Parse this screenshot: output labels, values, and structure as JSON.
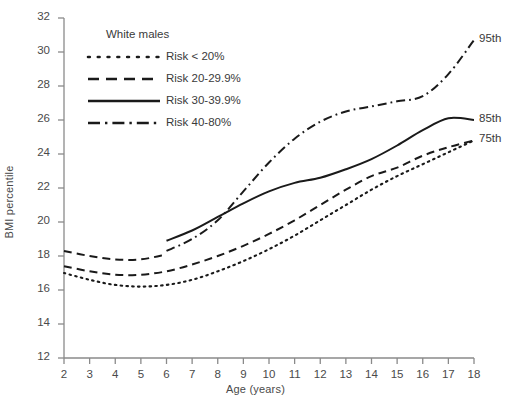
{
  "chart_data": {
    "type": "line",
    "title": "",
    "xlabel": "Age (years)",
    "ylabel": "BMI percentile",
    "xlim": [
      2,
      18
    ],
    "ylim": [
      12,
      32
    ],
    "xticks": [
      2,
      3,
      4,
      5,
      6,
      7,
      8,
      9,
      10,
      11,
      12,
      13,
      14,
      15,
      16,
      17,
      18
    ],
    "yticks": [
      12,
      14,
      16,
      18,
      20,
      22,
      24,
      26,
      28,
      30,
      32
    ],
    "grid": false,
    "legend_position": "top-left",
    "legend_title": "White males",
    "series": [
      {
        "name": "Risk < 20%",
        "style": "dotted",
        "end_label": "",
        "x": [
          2,
          3,
          4,
          5,
          6,
          7,
          8,
          9,
          10,
          11,
          12,
          13,
          14,
          15,
          16,
          17,
          18
        ],
        "values": [
          17.0,
          16.6,
          16.3,
          16.2,
          16.3,
          16.6,
          17.1,
          17.7,
          18.4,
          19.2,
          20.1,
          21.0,
          21.9,
          22.7,
          23.4,
          24.1,
          24.8
        ]
      },
      {
        "name": "Risk 20-29.9%",
        "style": "dashed",
        "end_label": "75th",
        "x": [
          2,
          3,
          4,
          5,
          6,
          7,
          8,
          9,
          10,
          11,
          12,
          13,
          14,
          15,
          16,
          17,
          18
        ],
        "values": [
          17.4,
          17.1,
          16.9,
          16.9,
          17.1,
          17.5,
          18.0,
          18.6,
          19.3,
          20.1,
          21.0,
          21.9,
          22.7,
          23.2,
          23.9,
          24.4,
          24.8
        ]
      },
      {
        "name": "Risk 30-39.9%",
        "style": "solid",
        "end_label": "85th",
        "x": [
          6,
          7,
          8,
          9,
          10,
          11,
          12,
          13,
          14,
          15,
          16,
          17,
          18
        ],
        "values": [
          18.9,
          19.5,
          20.3,
          21.1,
          21.8,
          22.3,
          22.6,
          23.1,
          23.7,
          24.5,
          25.4,
          26.1,
          26.0
        ]
      },
      {
        "name": "Risk 40-80%",
        "style": "dashdot",
        "end_label": "95th",
        "x": [
          6,
          7,
          8,
          9,
          10,
          11,
          12,
          13,
          14,
          15,
          16,
          17,
          18
        ],
        "values": [
          18.3,
          19.0,
          20.1,
          21.8,
          23.5,
          24.9,
          25.9,
          26.5,
          26.8,
          27.1,
          27.4,
          28.7,
          30.7
        ]
      },
      {
        "name": "Risk 20-29.9% upper",
        "style": "dashed-upper",
        "end_label": "",
        "x": [
          2,
          3,
          4,
          5,
          6
        ],
        "values": [
          18.3,
          18.0,
          17.8,
          17.8,
          18.1
        ]
      }
    ],
    "end_labels": [
      {
        "text": "95th",
        "x": 18,
        "y": 30.7
      },
      {
        "text": "85th",
        "x": 18,
        "y": 26.0
      },
      {
        "text": "75th",
        "x": 18,
        "y": 24.8
      }
    ]
  },
  "legend": {
    "title": "White males",
    "items": [
      {
        "label": "Risk < 20%",
        "style": "dotted"
      },
      {
        "label": "Risk 20-29.9%",
        "style": "dashed"
      },
      {
        "label": "Risk 30-39.9%",
        "style": "solid"
      },
      {
        "label": "Risk 40-80%",
        "style": "dashdot"
      }
    ]
  },
  "axes": {
    "x_title": "Age (years)",
    "y_title": "BMI percentile",
    "x_ticks": [
      "2",
      "3",
      "4",
      "5",
      "6",
      "7",
      "8",
      "9",
      "10",
      "11",
      "12",
      "13",
      "14",
      "15",
      "16",
      "17",
      "18"
    ],
    "y_ticks": [
      "12",
      "14",
      "16",
      "18",
      "20",
      "22",
      "24",
      "26",
      "28",
      "30",
      "32"
    ]
  },
  "colors": {
    "line": "#1a1a1a",
    "axis": "#8a8a8a",
    "text": "#3a3a3a",
    "background": "#ffffff"
  }
}
